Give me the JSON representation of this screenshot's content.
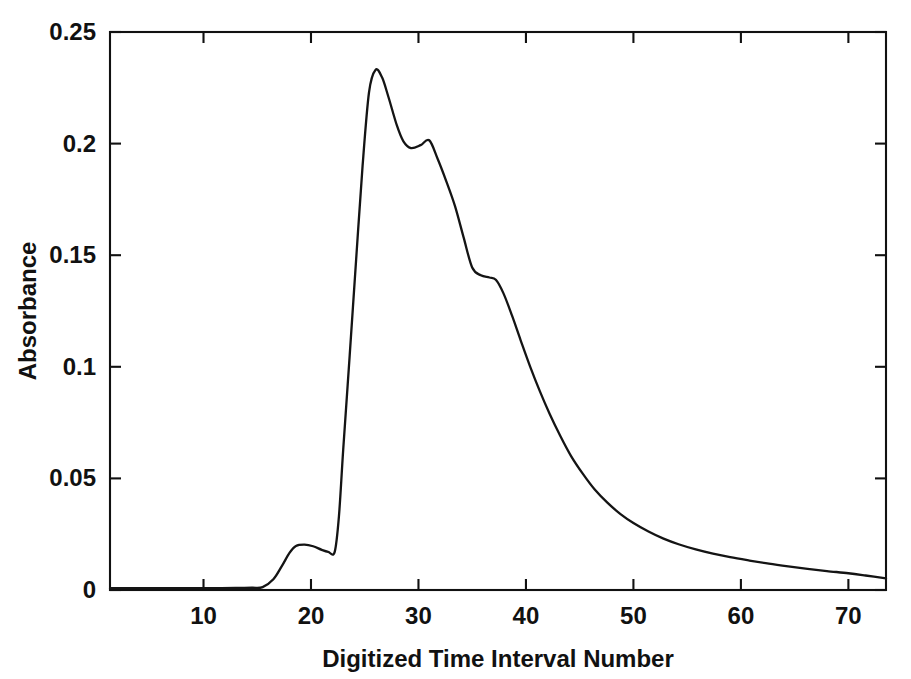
{
  "figure": {
    "background_color": "#ffffff",
    "line_color": "#141414",
    "axis_color": "#111111",
    "width": 911,
    "height": 679
  },
  "chart_data": {
    "type": "line",
    "title": "",
    "xlabel": "Digitized Time Interval Number",
    "ylabel": "Absorbance",
    "xlim": [
      1.3,
      73.5
    ],
    "ylim": [
      0,
      0.25
    ],
    "xticks": [
      10,
      20,
      30,
      40,
      50,
      60,
      70
    ],
    "xtick_labels": [
      "10",
      "20",
      "30",
      "40",
      "50",
      "60",
      "70"
    ],
    "yticks": [
      0,
      0.05,
      0.1,
      0.15,
      0.2,
      0.25
    ],
    "ytick_labels": [
      "0",
      "0.05",
      "0.1",
      "0.15",
      "0.2",
      "0.25"
    ],
    "grid": false,
    "legend": null,
    "series": [
      {
        "name": "Absorbance",
        "color": "#141414",
        "x": [
          1.3,
          3,
          5,
          7,
          9,
          11,
          13,
          14.5,
          15.5,
          16.5,
          17.3,
          18.0,
          18.6,
          19.4,
          20.2,
          21.0,
          21.6,
          22.2,
          22.6,
          23.0,
          23.6,
          24.2,
          24.8,
          25.4,
          26.0,
          26.6,
          27.2,
          28.0,
          28.6,
          29.3,
          30.2,
          31.0,
          31.8,
          32.6,
          33.4,
          34.2,
          35.0,
          35.8,
          36.6,
          37.2,
          37.9,
          38.7,
          39.5,
          40.4,
          41.3,
          42.2,
          43.2,
          44.2,
          45.3,
          46.4,
          47.6,
          48.8,
          50.0,
          51.4,
          52.8,
          54.2,
          55.8,
          57.4,
          59.0,
          60.8,
          62.6,
          64.4,
          66.2,
          68.0,
          70.0,
          71.6,
          73.5
        ],
        "y": [
          0.0008,
          0.0008,
          0.0008,
          0.0008,
          0.0008,
          0.0008,
          0.0009,
          0.001,
          0.0013,
          0.0048,
          0.0108,
          0.0166,
          0.0197,
          0.0203,
          0.0196,
          0.018,
          0.0171,
          0.017,
          0.033,
          0.063,
          0.105,
          0.148,
          0.19,
          0.223,
          0.233,
          0.2298,
          0.221,
          0.208,
          0.201,
          0.198,
          0.1993,
          0.2015,
          0.193,
          0.183,
          0.172,
          0.158,
          0.1445,
          0.141,
          0.14,
          0.139,
          0.133,
          0.123,
          0.112,
          0.1,
          0.089,
          0.079,
          0.069,
          0.06,
          0.052,
          0.045,
          0.039,
          0.034,
          0.03,
          0.0262,
          0.023,
          0.0205,
          0.0182,
          0.0163,
          0.0147,
          0.0132,
          0.0118,
          0.0106,
          0.0095,
          0.0085,
          0.0075,
          0.0065,
          0.0052
        ]
      }
    ]
  }
}
